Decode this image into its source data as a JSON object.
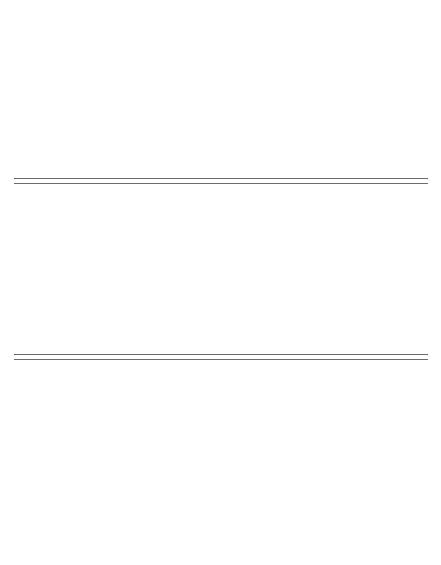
{
  "figure": {
    "groups": [
      "CHECK",
      "THURICIDE 90 TS",
      "BIOTROL VHZ",
      "CARBARYL",
      "AZODRIN"
    ],
    "months": [
      "Aug",
      "Sept",
      "Oct"
    ]
  },
  "chart_data": [
    {
      "type": "bar",
      "title": "BOLLWORM POPULATION",
      "xlabel": "BOLLWORM POPULATION",
      "ylabel": "BOLLWORMS / 300 SAMPLE UNITS",
      "ylim": [
        0,
        40
      ],
      "yticks": [
        0,
        10,
        20,
        30,
        40
      ],
      "grid": false,
      "categories": [
        "23",
        "30",
        "4",
        "7",
        "20",
        "27",
        "5"
      ],
      "month_labels": [
        "Aug",
        "Sept",
        "Oct"
      ],
      "series": [
        {
          "name": "CHECK",
          "values": [
            1.8,
            1.8,
            1.7,
            17.5,
            19.5,
            23.5,
            20.5
          ]
        },
        {
          "name": "THURICIDE 90 TS",
          "values": [
            0.8,
            3.2,
            3.2,
            22.2,
            16.2,
            18.0,
            24.0
          ]
        },
        {
          "name": "BIOTROL VHZ",
          "values": [
            3.0,
            3.0,
            2.1,
            15.0,
            17.0,
            19.0,
            28.8
          ]
        },
        {
          "name": "CARBARYL",
          "values": [
            1.1,
            1.1,
            3.0,
            20.0,
            20.8,
            21.7,
            18.7
          ]
        },
        {
          "name": "AZODRIN",
          "values": [
            0.5,
            2.0,
            21.0,
            30.0,
            23.0,
            35.0,
            25.0
          ]
        }
      ],
      "annotations": [
        {
          "group": "THURICIDE 90 TS",
          "label": "TRT",
          "at": 3,
          "double": true
        },
        {
          "group": "THURICIDE 90 TS",
          "label": "TRT",
          "at": 4,
          "double": false
        },
        {
          "group": "BIOTROL VHZ",
          "label": "TRT",
          "at": 3,
          "double": true
        },
        {
          "group": "BIOTROL VHZ",
          "label": "TRT",
          "at": 4,
          "double": false
        },
        {
          "group": "CARBARYL",
          "label": "TRT",
          "at": 3,
          "double": true
        },
        {
          "group": "CARBARYL",
          "label": "TRT",
          "at": 4,
          "double": false
        },
        {
          "group": "AZODRIN",
          "label": "TRT",
          "at": 2,
          "double": true
        },
        {
          "group": "AZODRIN",
          "label": "2\nREP\nTRT TRT",
          "at": 3,
          "double": false
        }
      ]
    },
    {
      "type": "bar",
      "title": "PREDATOR POPULATION",
      "xlabel": "PREDATOR POPULATION",
      "ylabel": "PREDATORS / 300 TERMINALS",
      "ylim": [
        0,
        500
      ],
      "yticks": [
        0,
        100,
        200,
        300,
        400,
        500
      ],
      "grid": false,
      "stacked": true,
      "categories": [
        "23",
        "4",
        "21",
        "28",
        "6"
      ],
      "month_labels": [
        "Aug",
        "Sept",
        "Oct"
      ],
      "legend": [
        "Orius",
        "Geocoris",
        "Chrysopa",
        "Other"
      ],
      "legend_position": "top-left",
      "groups": [
        {
          "name": "CHECK",
          "bars": [
            {
              "Orius": 165,
              "Geocoris": 30,
              "Chrysopa": 15,
              "Other": 100
            },
            {
              "Orius": 235,
              "Geocoris": 45,
              "Chrysopa": 28,
              "Other": 162
            },
            {
              "Orius": 120,
              "Geocoris": 18,
              "Chrysopa": 15,
              "Other": 97
            },
            {
              "Orius": 48,
              "Geocoris": 12,
              "Chrysopa": 18,
              "Other": 62
            },
            {
              "Orius": 65,
              "Geocoris": 12,
              "Chrysopa": 10,
              "Other": 98
            }
          ]
        },
        {
          "name": "THURICIDE 90 TS",
          "bars": [
            {
              "Orius": 95,
              "Geocoris": 18,
              "Chrysopa": 10,
              "Other": 52
            },
            {
              "Orius": 185,
              "Geocoris": 30,
              "Chrysopa": 28,
              "Other": 117
            },
            {
              "Orius": 110,
              "Geocoris": 12,
              "Chrysopa": 10,
              "Other": 88
            },
            {
              "Orius": 55,
              "Geocoris": 12,
              "Chrysopa": 10,
              "Other": 58
            },
            {
              "Orius": 35,
              "Geocoris": 15,
              "Chrysopa": 12,
              "Other": 93
            }
          ]
        },
        {
          "name": "BIOTROL VHZ",
          "bars": [
            {
              "Orius": 100,
              "Geocoris": 28,
              "Chrysopa": 12,
              "Other": 85
            },
            {
              "Orius": 230,
              "Geocoris": 22,
              "Chrysopa": 20,
              "Other": 113
            },
            {
              "Orius": 175,
              "Geocoris": 12,
              "Chrysopa": 10,
              "Other": 58
            },
            {
              "Orius": 88,
              "Geocoris": 10,
              "Chrysopa": 8,
              "Other": 34
            },
            {
              "Orius": 145,
              "Geocoris": 10,
              "Chrysopa": 8,
              "Other": 77
            }
          ]
        },
        {
          "name": "CARBARYL",
          "bars": [
            {
              "Orius": 50,
              "Geocoris": 8,
              "Chrysopa": 6,
              "Other": 16
            },
            {
              "Orius": 105,
              "Geocoris": 10,
              "Chrysopa": 8,
              "Other": 67
            },
            {
              "Orius": 38,
              "Geocoris": 6,
              "Chrysopa": 6,
              "Other": 10
            },
            {
              "Orius": 48,
              "Geocoris": 8,
              "Chrysopa": 6,
              "Other": 18
            },
            {
              "Orius": 82,
              "Geocoris": 12,
              "Chrysopa": 10,
              "Other": 76
            }
          ]
        },
        {
          "name": "AZODRIN",
          "bars": [
            {
              "Orius": 60,
              "Geocoris": 10,
              "Chrysopa": 8,
              "Other": 42
            },
            {
              "Orius": 118,
              "Geocoris": 14,
              "Chrysopa": 10,
              "Other": 88
            },
            {
              "Orius": 86,
              "Geocoris": 10,
              "Chrysopa": 8,
              "Other": 76
            },
            {
              "Orius": 55,
              "Geocoris": 8,
              "Chrysopa": 6,
              "Other": 41
            },
            {
              "Orius": 40,
              "Geocoris": 8,
              "Chrysopa": 6,
              "Other": 46
            }
          ]
        }
      ]
    },
    {
      "type": "bar",
      "title": "DAMAGED BOLLS",
      "xlabel": "DAMAGED BOLLS",
      "ylabel": "DAMAGED BOLLS / 300 SAMPLE UNITS",
      "ylim": [
        0,
        60
      ],
      "yticks": [
        0,
        10,
        20,
        30,
        40,
        50,
        60
      ],
      "grid": false,
      "categories": [
        "23",
        "30",
        "4",
        "7",
        "20",
        "27",
        "5"
      ],
      "month_labels": [
        "Aug",
        "Sept",
        "Oct"
      ],
      "series": [
        {
          "name": "CHECK",
          "values": [
            2.4,
            5.8,
            7.9,
            11.7,
            24.8,
            41.7,
            41.6
          ]
        },
        {
          "name": "THURICIDE 90 TS",
          "values": [
            0.7,
            7.6,
            10.6,
            5.5,
            22.5,
            35.6,
            42.4
          ]
        },
        {
          "name": "BIOTROL VHZ",
          "values": [
            8.7,
            4.7,
            3.8,
            9.7,
            19.7,
            23.7,
            44.3
          ]
        },
        {
          "name": "CARBARYL",
          "values": [
            3.2,
            4.8,
            7.9,
            12.8,
            21.7,
            36.6,
            38.6
          ]
        },
        {
          "name": "AZODRIN",
          "values": [
            1.9,
            4.9,
            8.8,
            20.7,
            20.6,
            38.6,
            59.5
          ]
        }
      ]
    }
  ]
}
